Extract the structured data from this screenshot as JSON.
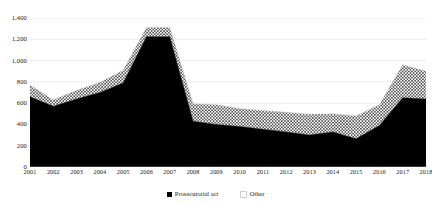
{
  "chart_data": {
    "type": "area",
    "stacked": true,
    "title": "",
    "xlabel": "",
    "ylabel": "",
    "categories": [
      "2001",
      "2002",
      "2003",
      "2004",
      "2005",
      "2006",
      "2007",
      "2008",
      "2009",
      "2010",
      "2011",
      "2012",
      "2013",
      "2014",
      "2015",
      "2016",
      "2017",
      "2018"
    ],
    "series": [
      {
        "name": "Prosecutorial act",
        "color": "#000000",
        "fill": "solid",
        "values": [
          660,
          570,
          640,
          700,
          790,
          1225,
          1225,
          430,
          400,
          380,
          355,
          330,
          300,
          330,
          265,
          390,
          650,
          640
        ]
      },
      {
        "name": "Other",
        "color": "#4a4a4a",
        "fill": "dotted",
        "values": [
          110,
          60,
          80,
          95,
          120,
          85,
          85,
          165,
          185,
          170,
          175,
          185,
          195,
          170,
          215,
          195,
          310,
          260
        ]
      }
    ],
    "totals": [
      770,
      630,
      720,
      795,
      910,
      1310,
      1310,
      595,
      585,
      550,
      530,
      515,
      495,
      500,
      480,
      585,
      960,
      900
    ],
    "ylim": [
      0,
      1400
    ],
    "yticks": [
      0,
      200,
      400,
      600,
      800,
      1000,
      1200,
      1400
    ],
    "ytick_labels": [
      "0",
      "200",
      "400",
      "600",
      "800",
      "1,000",
      "1,200",
      "1,400"
    ],
    "grid": true,
    "grid_color": "#d9d9d9",
    "legend_position": "bottom",
    "legend": [
      {
        "label": "Prosecutorial act",
        "marker": "solid-square",
        "color": "#000000"
      },
      {
        "label": "Other",
        "marker": "dotted-square",
        "color": "#7a7a7a"
      }
    ]
  }
}
